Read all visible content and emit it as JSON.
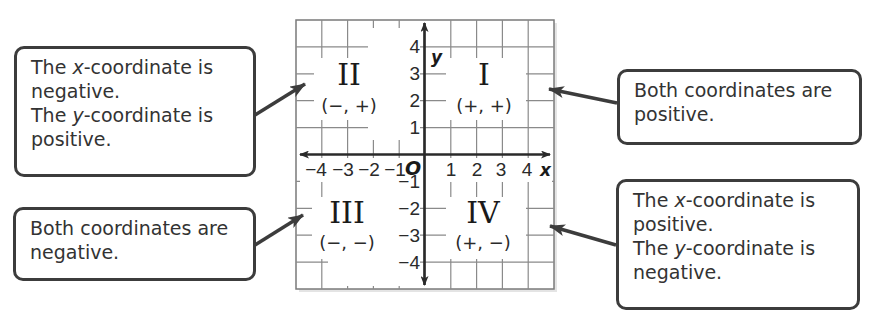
{
  "diagram": {
    "grid": {
      "xmin": -5,
      "xmax": 5,
      "ymin": -5,
      "ymax": 5,
      "step": 1
    },
    "axes": {
      "x_label": "x",
      "y_label": "y",
      "origin_label": "O",
      "x_ticks": [
        "−4",
        "−3",
        "−2",
        "−1",
        "1",
        "2",
        "3",
        "4"
      ],
      "y_ticks": [
        "4",
        "3",
        "2",
        "1",
        "−1",
        "−2",
        "−3",
        "−4"
      ]
    },
    "quadrants": [
      {
        "id": "I",
        "numeral": "I",
        "signs": "(+, +)"
      },
      {
        "id": "II",
        "numeral": "II",
        "signs": "(−, +)"
      },
      {
        "id": "III",
        "numeral": "III",
        "signs": "(−, −)"
      },
      {
        "id": "IV",
        "numeral": "IV",
        "signs": "(+, −)"
      }
    ],
    "callouts": {
      "quadrant_ii": {
        "line1_pre": "The ",
        "line1_var": "x",
        "line1_post": "-coordinate is",
        "line2": "negative.",
        "line3_pre": "The ",
        "line3_var": "y",
        "line3_post": "-coordinate is",
        "line4": "positive."
      },
      "quadrant_i": {
        "line1": "Both coordinates are",
        "line2": "positive."
      },
      "quadrant_iii": {
        "line1": "Both coordinates are",
        "line2": "negative."
      },
      "quadrant_iv": {
        "line1_pre": "The ",
        "line1_var": "x",
        "line1_post": "-coordinate is",
        "line2": "positive.",
        "line3_pre": "The ",
        "line3_var": "y",
        "line3_post": "-coordinate is",
        "line4": "negative."
      }
    },
    "colors": {
      "grid": "#7a7a7a",
      "axis": "#2a2a2a",
      "callout_border": "#3c3c3c",
      "arrow": "#3c3c3c",
      "text": "#333333"
    }
  }
}
